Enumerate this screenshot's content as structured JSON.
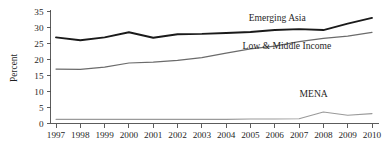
{
  "chart_data": {
    "type": "line",
    "title": "",
    "xlabel": "",
    "ylabel": "Percent",
    "x": [
      1997,
      1998,
      1999,
      2000,
      2001,
      2002,
      2003,
      2004,
      2005,
      2006,
      2007,
      2008,
      2009,
      2010
    ],
    "xtick_labels": [
      "1997",
      "1998",
      "1999",
      "2000",
      "2001",
      "2002",
      "2003",
      "2004",
      "2005",
      "2006",
      "2007",
      "2008",
      "2009",
      "2010"
    ],
    "ytick_labels": [
      "0",
      "5",
      "10",
      "15",
      "20",
      "25",
      "30",
      "35"
    ],
    "yticks": [
      0,
      5,
      10,
      15,
      20,
      25,
      30,
      35
    ],
    "ylim": [
      0,
      35
    ],
    "xlim": [
      1997,
      2010
    ],
    "grid": false,
    "legend_position": "inline-annotations",
    "series": [
      {
        "name": "Emerging Asia",
        "color": "#1a1a1a",
        "width": 1.9,
        "label_x": 2006.1,
        "label_y": 32.0,
        "values": [
          26.9,
          26.0,
          26.9,
          28.5,
          26.8,
          27.9,
          28.0,
          28.3,
          28.6,
          29.2,
          29.5,
          29.2,
          31.2,
          33.0
        ]
      },
      {
        "name": "Low & Middle Income",
        "color": "#6b6b6b",
        "width": 1.2,
        "label_x": 2006.5,
        "label_y": 23.4,
        "values": [
          17.0,
          16.9,
          17.6,
          18.9,
          19.2,
          19.7,
          20.6,
          22.0,
          23.3,
          24.2,
          25.6,
          26.6,
          27.3,
          28.5
        ]
      },
      {
        "name": "MENA",
        "color": "#9a9a9a",
        "width": 1.1,
        "label_x": 2007.6,
        "label_y": 8.3,
        "values": [
          1.3,
          1.3,
          1.3,
          1.3,
          1.3,
          1.3,
          1.3,
          1.3,
          1.4,
          1.4,
          1.5,
          3.6,
          2.6,
          3.1
        ]
      }
    ]
  }
}
